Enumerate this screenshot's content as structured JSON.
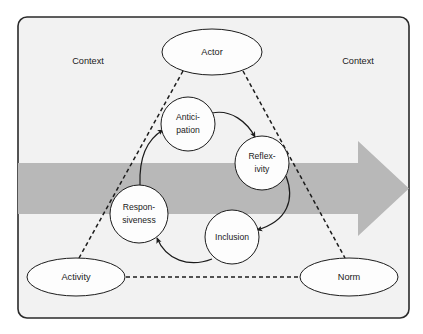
{
  "figure": {
    "panel": {
      "background_color": "#f2f2f2",
      "border_color": "#2a2a2a"
    },
    "band": {
      "name": "process-arrow",
      "color": "#b8b8b8",
      "direction": "left-to-right"
    }
  },
  "context_labels": [
    {
      "id": "context-left",
      "text": "Context"
    },
    {
      "id": "context-right",
      "text": "Context"
    }
  ],
  "outer_nodes": [
    {
      "id": "actor",
      "text": "Actor",
      "shape": "ellipse",
      "cx": 212,
      "cy": 52,
      "rx": 50,
      "ry": 23
    },
    {
      "id": "activity",
      "text": "Activity",
      "shape": "ellipse",
      "cx": 76,
      "cy": 277,
      "rx": 49,
      "ry": 19
    },
    {
      "id": "norm",
      "text": "Norm",
      "shape": "ellipse",
      "cx": 349,
      "cy": 277,
      "rx": 49,
      "ry": 19
    }
  ],
  "inner_nodes": [
    {
      "id": "anticipation",
      "line1": "Antici-",
      "line2": "pation",
      "shape": "circle",
      "cx": 188,
      "cy": 124,
      "r": 27
    },
    {
      "id": "reflexivity",
      "line1": "Reflex-",
      "line2": "ivity",
      "shape": "circle",
      "cx": 262,
      "cy": 163,
      "r": 27
    },
    {
      "id": "inclusion",
      "line1": "Inclusion",
      "line2": "",
      "shape": "circle",
      "cx": 232,
      "cy": 237,
      "r": 27
    },
    {
      "id": "responsiveness",
      "line1": "Respon-",
      "line2": "siveness",
      "shape": "circle",
      "cx": 139,
      "cy": 214,
      "r": 29
    }
  ],
  "cycle_edges": [
    {
      "id": "anticipation-to-reflexivity",
      "from": "anticipation",
      "to": "reflexivity",
      "style": "curved-arrow"
    },
    {
      "id": "reflexivity-to-inclusion",
      "from": "reflexivity",
      "to": "inclusion",
      "style": "curved-arrow"
    },
    {
      "id": "inclusion-to-responsiveness",
      "from": "inclusion",
      "to": "responsiveness",
      "style": "curved-arrow"
    },
    {
      "id": "responsiveness-to-anticipation",
      "from": "responsiveness",
      "to": "anticipation",
      "style": "curved-arrow"
    }
  ],
  "triangle_edges": [
    {
      "id": "actor-activity",
      "from": "actor",
      "to": "activity",
      "style": "dashed"
    },
    {
      "id": "actor-norm",
      "from": "actor",
      "to": "norm",
      "style": "dashed"
    },
    {
      "id": "activity-norm",
      "from": "activity",
      "to": "norm",
      "style": "dashed"
    }
  ]
}
